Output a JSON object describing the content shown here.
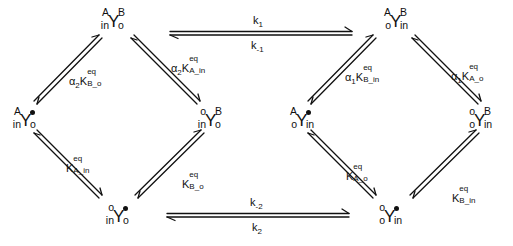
{
  "diagram": {
    "type": "kinetic-scheme",
    "left_cycle": {
      "nodes": {
        "top": {
          "id": "in_A_o_B",
          "base": "Y",
          "top_left": "A",
          "bottom_left": "in",
          "top_right": "B",
          "bottom_right": "o"
        },
        "left": {
          "id": "in_A_o_empty",
          "base": "Y",
          "top_left": "A",
          "bottom_left": "in",
          "top_right": "•",
          "bottom_right": "o"
        },
        "right": {
          "id": "in_empty_o_B",
          "base": "Y",
          "top_left": "o",
          "bottom_left": "in",
          "top_right": "B",
          "bottom_right": "o"
        },
        "bottom": {
          "id": "in_empty_o_empty",
          "base": "Y",
          "top_left": "o",
          "bottom_left": "in",
          "top_right": "•",
          "bottom_right": "o"
        }
      },
      "edges": {
        "left_top": {
          "prefix": "α",
          "prefix_sub": "2",
          "K": "K",
          "sup": "eq",
          "sub": "B_o"
        },
        "top_right": {
          "prefix": "α",
          "prefix_sub": "2",
          "K": "K",
          "sup": "eq",
          "sub": "A_in"
        },
        "left_bottom": {
          "prefix": "",
          "prefix_sub": "",
          "K": "K",
          "sup": "eq",
          "sub": "A_in"
        },
        "bottom_right": {
          "prefix": "",
          "prefix_sub": "",
          "K": "K",
          "sup": "eq",
          "sub": "B_o"
        }
      }
    },
    "right_cycle": {
      "nodes": {
        "top": {
          "id": "o_A_in_B",
          "base": "Y",
          "top_left": "A",
          "bottom_left": "o",
          "top_right": "B",
          "bottom_right": "in"
        },
        "left": {
          "id": "o_A_in_empty",
          "base": "Y",
          "top_left": "A",
          "bottom_left": "o",
          "top_right": "•",
          "bottom_right": "in"
        },
        "right": {
          "id": "o_empty_in_B",
          "base": "Y",
          "top_left": "o",
          "bottom_left": "o",
          "top_right": "B",
          "bottom_right": "in"
        },
        "bottom": {
          "id": "o_empty_in_empty",
          "base": "Y",
          "top_left": "o",
          "bottom_left": "o",
          "top_right": "•",
          "bottom_right": "in"
        }
      },
      "edges": {
        "left_top": {
          "prefix": "α",
          "prefix_sub": "1",
          "K": "K",
          "sup": "eq",
          "sub": "B_in"
        },
        "top_right": {
          "prefix": "α",
          "prefix_sub": "1",
          "K": "K",
          "sup": "eq",
          "sub": "A_o"
        },
        "left_bottom": {
          "prefix": "",
          "prefix_sub": "",
          "K": "K",
          "sup": "eq",
          "sub": "A_o"
        },
        "bottom_right": {
          "prefix": "",
          "prefix_sub": "",
          "K": "K",
          "sup": "eq",
          "sub": "B_in"
        }
      }
    },
    "transitions": {
      "top": {
        "above": {
          "k": "k",
          "sub": "1"
        },
        "below": {
          "k": "k",
          "sub": "-1"
        }
      },
      "bottom": {
        "above": {
          "k": "k",
          "sub": "-2"
        },
        "below": {
          "k": "k",
          "sub": "2"
        }
      }
    },
    "colors": {
      "ink": "#111111",
      "background": "#ffffff"
    }
  }
}
